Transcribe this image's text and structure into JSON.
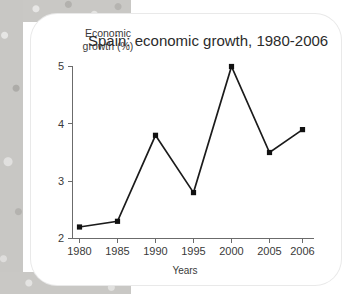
{
  "chart_data": {
    "type": "line",
    "title": "Spain: economic growth, 1980-2006",
    "xlabel": "Years",
    "ylabel": "Economic\ngrowth (%)",
    "x": [
      1980,
      1985,
      1990,
      1995,
      2000,
      2005,
      2006
    ],
    "categories": [
      "1980",
      "1985",
      "1990",
      "1995",
      "2000",
      "2005",
      "2006"
    ],
    "values": [
      2.2,
      2.3,
      3.8,
      2.8,
      5.0,
      3.5,
      3.9
    ],
    "series": [
      {
        "name": "Economic growth (%)",
        "values": [
          2.2,
          2.3,
          3.8,
          2.8,
          5.0,
          3.5,
          3.9
        ]
      }
    ],
    "ylim": [
      2,
      5
    ],
    "yticks": [
      2,
      3,
      4,
      5
    ],
    "ytick_labels": [
      "2",
      "3",
      "4",
      "5"
    ],
    "xtick_labels": [
      "1980",
      "1985",
      "1990",
      "1995",
      "2000",
      "2005",
      "2006"
    ],
    "grid": false,
    "legend": false,
    "marker": "square",
    "line_color": "#1b1b1b",
    "marker_color": "#111111",
    "axis_color": "#6b6b6b",
    "background_color": "#ffffff",
    "page_background_color": "#c9c8c5"
  },
  "card": {
    "y_axis_label": "Economic\ngrowth (%)",
    "title": "Spain: economic growth, 1980-2006",
    "x_axis_label": "Years"
  }
}
